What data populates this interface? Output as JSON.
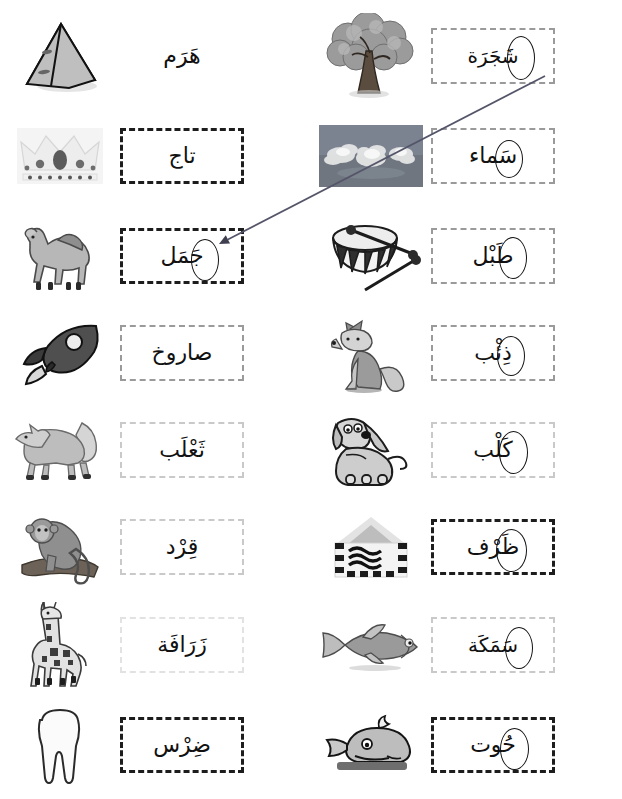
{
  "worksheet": {
    "title": "Arabic picture-word matching worksheet",
    "language": "Arabic",
    "direction": "rtl",
    "background_color": "#ffffff",
    "ink_color": "#111111",
    "box_border_dark": "#1d1d1d",
    "box_border_light": "#c9c9c9",
    "connector_color": "#55556a"
  },
  "columns": {
    "left": {
      "name": "left-column",
      "rows": [
        {
          "index": 0,
          "picture": "pyramid-icon",
          "word": "هَرَم",
          "transliteration": "haram",
          "meaning": "pyramid",
          "box_style": "none",
          "circled_letter": null
        },
        {
          "index": 1,
          "picture": "crown-icon",
          "word": "تاج",
          "transliteration": "taaj",
          "meaning": "crown",
          "box_style": "dark",
          "circled_letter": null
        },
        {
          "index": 2,
          "picture": "camel-icon",
          "word": "جَمَل",
          "transliteration": "jamal",
          "meaning": "camel",
          "box_style": "dark",
          "circled_letter": "جَ"
        },
        {
          "index": 3,
          "picture": "rocket-icon",
          "word": "صاروخ",
          "transliteration": "saarookh",
          "meaning": "rocket",
          "box_style": "mid",
          "circled_letter": null
        },
        {
          "index": 4,
          "picture": "fox-icon",
          "word": "ثَعْلَب",
          "transliteration": "tha'lab",
          "meaning": "fox",
          "box_style": "light",
          "circled_letter": null
        },
        {
          "index": 5,
          "picture": "monkey-icon",
          "word": "قِرْد",
          "transliteration": "qird",
          "meaning": "monkey",
          "box_style": "light",
          "circled_letter": null
        },
        {
          "index": 6,
          "picture": "giraffe-icon",
          "word": "زَرَافَة",
          "transliteration": "zaraafah",
          "meaning": "giraffe",
          "box_style": "faint",
          "circled_letter": null
        },
        {
          "index": 7,
          "picture": "tooth-icon",
          "word": "ضِرْس",
          "transliteration": "dirs",
          "meaning": "molar tooth",
          "box_style": "dark",
          "circled_letter": null
        }
      ]
    },
    "right": {
      "name": "right-column",
      "rows": [
        {
          "index": 0,
          "picture": "tree-icon",
          "word": "شَجَرَة",
          "transliteration": "shajarah",
          "meaning": "tree",
          "box_style": "mid",
          "circled_letter": "شَ"
        },
        {
          "index": 1,
          "picture": "sky-clouds-photo",
          "word": "سَماء",
          "transliteration": "samaa'",
          "meaning": "sky",
          "box_style": "mid",
          "circled_letter": "سَ"
        },
        {
          "index": 2,
          "picture": "drum-icon",
          "word": "طَبْل",
          "transliteration": "tabl",
          "meaning": "drum",
          "box_style": "mid",
          "circled_letter": "طَ"
        },
        {
          "index": 3,
          "picture": "wolf-icon",
          "word": "ذِئْب",
          "transliteration": "dhi'b",
          "meaning": "wolf",
          "box_style": "mid",
          "circled_letter": "ذِ"
        },
        {
          "index": 4,
          "picture": "dog-icon",
          "word": "كَلْب",
          "transliteration": "kalb",
          "meaning": "dog",
          "box_style": "light",
          "circled_letter": "كَ"
        },
        {
          "index": 5,
          "picture": "envelope-icon",
          "word": "ظَرْف",
          "transliteration": "zarf",
          "meaning": "envelope",
          "box_style": "dark",
          "circled_letter": "ظَ"
        },
        {
          "index": 6,
          "picture": "fish-icon",
          "word": "سَمَكَة",
          "transliteration": "samakah",
          "meaning": "fish",
          "box_style": "light",
          "circled_letter": "سَ"
        },
        {
          "index": 7,
          "picture": "whale-icon",
          "word": "حُوت",
          "transliteration": "hoot",
          "meaning": "whale",
          "box_style": "dark",
          "circled_letter": "حُ"
        }
      ]
    }
  },
  "connector": {
    "name": "answer-line",
    "from_label": "شَجَرَة",
    "to_label": "جَمَل",
    "from_point": [
      545,
      76
    ],
    "to_point": [
      219,
      244
    ],
    "has_arrowhead": true,
    "color": "#55556a"
  }
}
